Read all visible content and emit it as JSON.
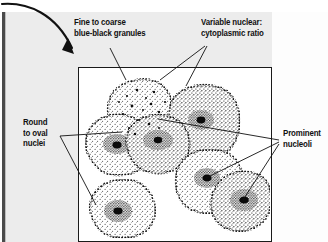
{
  "figure": {
    "kind": "histology-illustration",
    "caption_labels": [
      {
        "id": "granules",
        "line1": "Fine to coarse",
        "line2": "blue-black granules"
      },
      {
        "id": "ratio",
        "line1": "Variable nuclear:",
        "line2": "cytoplasmic ratio"
      },
      {
        "id": "nuclei",
        "line1": "Round",
        "line2": "to oval",
        "line3": "nuclei"
      },
      {
        "id": "nucleoli",
        "line1": "Prominent",
        "line2": "nucleoli"
      }
    ],
    "colors": {
      "background": "#ececec",
      "panel": "#ffffff",
      "ink": "#1a1a1a",
      "edge_strip": "#4a4a4a"
    },
    "elements": {
      "curved_arrow": "curved-arrow-icon",
      "illustration": "cell-cluster-illustration"
    }
  }
}
